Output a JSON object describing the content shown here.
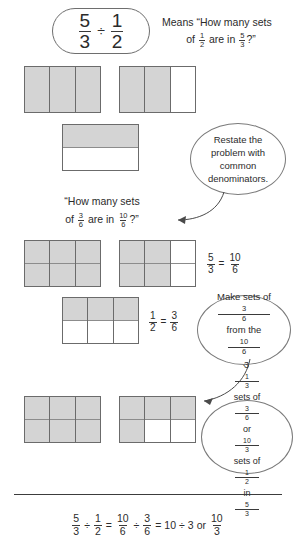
{
  "expression_box": {
    "name": "5/3 divided by 1/2",
    "left_fraction": {
      "numerator": "5",
      "denominator": "3"
    },
    "operator": "÷",
    "right_fraction": {
      "numerator": "1",
      "denominator": "2"
    }
  },
  "intro_text": {
    "line1": "Means “How many sets",
    "line2_prefix": "of ",
    "line2_fraction": {
      "numerator": "1",
      "denominator": "2"
    },
    "line2_middle": " are in ",
    "line2_fraction2": {
      "numerator": "5",
      "denominator": "3"
    },
    "line2_suffix": "?”"
  },
  "restate_text": {
    "prefix": "“How many sets",
    "line2_prefix": "of ",
    "fraction1": {
      "numerator": "3",
      "denominator": "6"
    },
    "middle": " are in ",
    "fraction2": {
      "numerator": "10",
      "denominator": "6"
    },
    "suffix": "?”"
  },
  "callouts": [
    {
      "id": "restate-callout",
      "lines": [
        "Restate the",
        "problem with",
        "common",
        "denominators."
      ]
    },
    {
      "id": "make-sets-callout",
      "line1_prefix": "Make sets of ",
      "line1_fraction": {
        "numerator": "3",
        "denominator": "6"
      },
      "line2_prefix": "from the ",
      "line2_fraction": {
        "numerator": "10",
        "denominator": "6"
      },
      "line2_suffix": "."
    },
    {
      "id": "answer-callout",
      "line1_mixed": {
        "whole": "3",
        "numerator": "1",
        "denominator": "3"
      },
      "line1_middle": " sets of ",
      "line1_fraction": {
        "numerator": "3",
        "denominator": "6"
      },
      "line2": "or",
      "line3_fraction1": {
        "numerator": "10",
        "denominator": "3"
      },
      "line3_middle": " sets of ",
      "line3_fraction2": {
        "numerator": "1",
        "denominator": "2"
      },
      "line3_middle2": " in ",
      "line3_fraction3": {
        "numerator": "5",
        "denominator": "3"
      }
    }
  ],
  "equations": {
    "thirds_to_sixths": {
      "left": {
        "numerator": "5",
        "denominator": "3"
      },
      "equals": "=",
      "right": {
        "numerator": "10",
        "denominator": "6"
      }
    },
    "half_to_sixths": {
      "left": {
        "numerator": "1",
        "denominator": "2"
      },
      "equals": "=",
      "right": {
        "numerator": "3",
        "denominator": "6"
      }
    }
  },
  "summary": {
    "f1": {
      "numerator": "5",
      "denominator": "3"
    },
    "op1": "÷",
    "f2": {
      "numerator": "1",
      "denominator": "2"
    },
    "eq1": "=",
    "f3": {
      "numerator": "10",
      "denominator": "6"
    },
    "op2": "÷",
    "f4": {
      "numerator": "3",
      "denominator": "6"
    },
    "eq2": "=",
    "whole1": "10",
    "op3": "÷",
    "whole2": "3",
    "or": "or",
    "f5": {
      "numerator": "10",
      "denominator": "3"
    }
  },
  "colors": {
    "shaded": "#d4d4d4",
    "outline": "#6b6b6b",
    "text": "#2b2b2b",
    "rule": "#3c3c3c"
  },
  "bar_models": {
    "row1": {
      "label": "five thirds shown as two wholes in thirds",
      "bars": [
        {
          "name": "bar-thirds-full",
          "columns": 3,
          "rows": 1,
          "shaded": [
            1,
            1,
            1
          ]
        },
        {
          "name": "bar-thirds-partial",
          "columns": 3,
          "rows": 1,
          "shaded": [
            1,
            1,
            0
          ]
        }
      ]
    },
    "row2": {
      "label": "one half",
      "bars": [
        {
          "name": "bar-halves",
          "columns": 1,
          "rows": 2,
          "shaded": [
            1,
            0
          ]
        }
      ]
    },
    "row3": {
      "label": "ten sixths shown as two wholes in sixths",
      "bars": [
        {
          "name": "bar-sixths-full",
          "columns": 3,
          "rows": 2,
          "shaded": [
            1,
            1,
            1,
            1,
            1,
            1
          ]
        },
        {
          "name": "bar-sixths-partial",
          "columns": 3,
          "rows": 2,
          "shaded": [
            1,
            1,
            1,
            1,
            0,
            0
          ]
        }
      ]
    },
    "row4": {
      "label": "three sixths equals one half",
      "bars": [
        {
          "name": "bar-three-sixths",
          "columns": 3,
          "rows": 2,
          "shaded": [
            1,
            1,
            1,
            0,
            0,
            0
          ]
        }
      ]
    },
    "row5": {
      "label": "ten sixths grouped into sets of three sixths",
      "bars": [
        {
          "name": "bar-sets-full",
          "columns": 3,
          "rows": 2,
          "shaded": [
            1,
            1,
            1,
            1,
            1,
            1
          ]
        },
        {
          "name": "bar-sets-partial",
          "columns": 3,
          "rows": 2,
          "shaded": [
            1,
            1,
            1,
            1,
            0,
            0
          ]
        }
      ]
    }
  }
}
